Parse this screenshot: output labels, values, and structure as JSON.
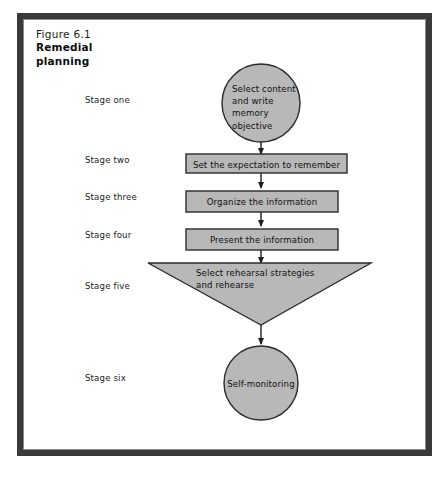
{
  "figure": {
    "number": "Figure 6.1",
    "title": "Remedial planning"
  },
  "colors": {
    "frame": "#3a3a3a",
    "shape_fill": "#b8b8b8",
    "shape_stroke": "#2b2b2b",
    "page_background": "#ffffff",
    "text": "#111111"
  },
  "stages": [
    {
      "label": "Stage one"
    },
    {
      "label": "Stage two"
    },
    {
      "label": "Stage three"
    },
    {
      "label": "Stage four"
    },
    {
      "label": "Stage five"
    },
    {
      "label": "Stage six"
    }
  ],
  "nodes": {
    "stage_one": {
      "shape": "ellipse",
      "text": "Select content and write memory objective",
      "lines": [
        "Select content",
        "and write",
        "memory",
        "objective"
      ]
    },
    "stage_two": {
      "shape": "rectangle",
      "text": "Set the expectation to remember"
    },
    "stage_three": {
      "shape": "rectangle",
      "text": "Organize the information"
    },
    "stage_four": {
      "shape": "rectangle",
      "text": "Present the information"
    },
    "stage_five": {
      "shape": "inverted-triangle",
      "text": "Select rehearsal strategies and rehearse",
      "lines": [
        "Select rehearsal strategies",
        "and rehearse"
      ]
    },
    "stage_six": {
      "shape": "ellipse",
      "text": "Self-monitoring"
    }
  },
  "connectors": [
    {
      "from": "stage_one",
      "to": "stage_two",
      "style": "arrow-down"
    },
    {
      "from": "stage_two",
      "to": "stage_three",
      "style": "arrow-down"
    },
    {
      "from": "stage_three",
      "to": "stage_four",
      "style": "arrow-down"
    },
    {
      "from": "stage_four",
      "to": "stage_five",
      "style": "arrow-down"
    },
    {
      "from": "stage_five",
      "to": "stage_six",
      "style": "arrow-down"
    }
  ]
}
